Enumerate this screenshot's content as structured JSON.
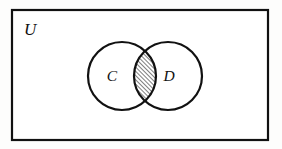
{
  "figure": {
    "type": "venn-diagram",
    "caption_text": "",
    "universe": {
      "label": "U",
      "label_x": 24,
      "label_y": 35,
      "rect": {
        "x": 12,
        "y": 10,
        "width": 256,
        "height": 130
      },
      "stroke": "#111111",
      "stroke_width": 2.2,
      "fill": "#ffffff"
    },
    "sets": [
      {
        "label": "C",
        "label_x": 112,
        "label_y": 81,
        "cx": 122,
        "cy": 76,
        "r": 34,
        "stroke": "#111111",
        "stroke_width": 2.2,
        "fill": "#ffffff"
      },
      {
        "label": "D",
        "label_x": 169,
        "label_y": 81,
        "cx": 168,
        "cy": 76,
        "r": 34,
        "stroke": "#111111",
        "stroke_width": 2.2,
        "fill": "#ffffff"
      }
    ],
    "shaded_region": {
      "name": "intersection",
      "notation": "C ∩ D",
      "fill_style": "diagonal-hatch",
      "hatch_direction": "up-right",
      "hatch_spacing": 3,
      "hatch_stroke": "#111111",
      "hatch_stroke_width": 1.1,
      "outline_stroke": "#111111",
      "outline_stroke_width": 2.2
    },
    "colors": {
      "ink": "#111111",
      "paper": "#fdfdfc"
    }
  }
}
